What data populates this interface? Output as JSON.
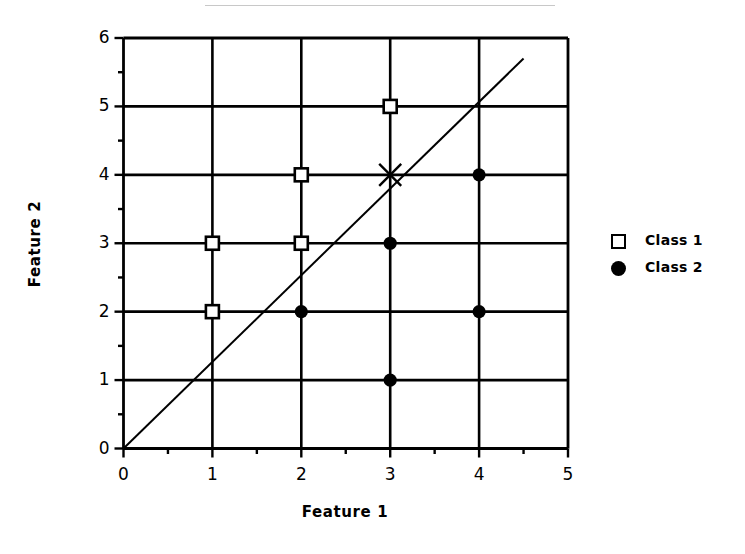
{
  "chart_data": {
    "type": "scatter",
    "title": "",
    "xlabel": "Feature 1",
    "ylabel": "Feature 2",
    "xlim": [
      0,
      5
    ],
    "ylim": [
      0,
      6
    ],
    "xticks": [
      0,
      1,
      2,
      3,
      4,
      5
    ],
    "yticks": [
      0,
      1,
      2,
      3,
      4,
      5,
      6
    ],
    "xtick_labels": [
      "0",
      "1",
      "2",
      "3",
      "4",
      "5"
    ],
    "ytick_labels": [
      "0",
      "1",
      "2",
      "3",
      "4",
      "5",
      "6"
    ],
    "minor_tick_step": 0.5,
    "grid": true,
    "grid_color": "#000000",
    "legend_position": "right",
    "series": [
      {
        "name": "Class 1",
        "marker": "open-square",
        "color": "#000000",
        "points": [
          {
            "x": 1,
            "y": 2
          },
          {
            "x": 1,
            "y": 3
          },
          {
            "x": 2,
            "y": 3
          },
          {
            "x": 2,
            "y": 4
          },
          {
            "x": 3,
            "y": 5
          }
        ]
      },
      {
        "name": "Class 2",
        "marker": "filled-circle",
        "color": "#000000",
        "points": [
          {
            "x": 2,
            "y": 2
          },
          {
            "x": 3,
            "y": 1
          },
          {
            "x": 3,
            "y": 3
          },
          {
            "x": 4,
            "y": 2
          },
          {
            "x": 4,
            "y": 4
          }
        ]
      },
      {
        "name": "Query point",
        "marker": "x-cross",
        "color": "#000000",
        "show_in_legend": false,
        "points": [
          {
            "x": 3,
            "y": 4
          }
        ]
      }
    ],
    "annotations": [
      {
        "name": "decision-boundary",
        "type": "line",
        "x0": 0,
        "y0": 0,
        "x1": 4.5,
        "y1": 5.7
      }
    ]
  },
  "legend": {
    "entries": [
      {
        "label": "Class 1",
        "marker": "open-square"
      },
      {
        "label": "Class 2",
        "marker": "filled-circle"
      }
    ]
  }
}
